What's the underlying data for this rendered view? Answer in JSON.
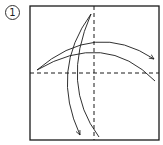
{
  "step": {
    "number": "1"
  },
  "colors": {
    "line": "#1a1a1a",
    "background": "#ffffff"
  },
  "diagram": {
    "type": "origami-fold-step",
    "square": {
      "x": 30,
      "y": 6,
      "width": 129,
      "height": 134
    },
    "valley_fold_lines": [
      {
        "orientation": "vertical",
        "x": 94
      },
      {
        "orientation": "horizontal",
        "y": 73
      }
    ],
    "arrows": [
      {
        "direction": "left-to-right",
        "from": [
          37,
          70
        ],
        "to": [
          154,
          59
        ],
        "arrowhead": true
      },
      {
        "direction": "top-to-bottom",
        "from": [
          91,
          14
        ],
        "to": [
          80,
          135
        ],
        "arrowhead": true
      }
    ],
    "guide_arcs": [
      {
        "from": [
          37,
          70
        ],
        "to": [
          155,
          81
        ]
      },
      {
        "from": [
          91,
          14
        ],
        "to": [
          99,
          137
        ]
      }
    ]
  }
}
